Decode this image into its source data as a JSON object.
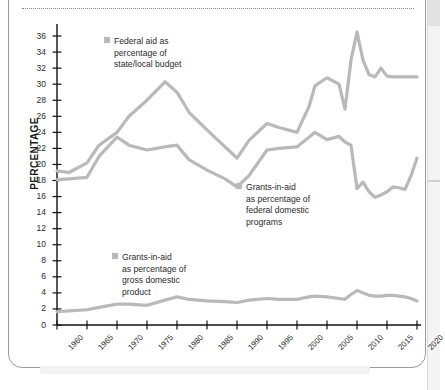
{
  "chart_data": {
    "type": "line",
    "title": "",
    "xlabel": "",
    "ylabel": "PERCENTAGE",
    "xlim": [
      1960,
      2020
    ],
    "ylim": [
      0,
      37
    ],
    "ytick_step": 2,
    "yticks": [
      0,
      2,
      4,
      6,
      8,
      10,
      12,
      14,
      16,
      18,
      20,
      22,
      24,
      26,
      28,
      30,
      32,
      34,
      36
    ],
    "xticks": [
      1960,
      1965,
      1970,
      1975,
      1980,
      1985,
      1990,
      1995,
      2000,
      2005,
      2010,
      2015,
      2020
    ],
    "grid": false,
    "legend_position": "inline-annotations",
    "line_color": "#b9b9b9",
    "series": [
      {
        "name": "Federal aid as percentage of state/local budget",
        "x": [
          1960,
          1962,
          1965,
          1967,
          1970,
          1972,
          1975,
          1978,
          1980,
          1982,
          1985,
          1988,
          1990,
          1992,
          1995,
          1997,
          2000,
          2002,
          2003,
          2005,
          2007,
          2008,
          2009,
          2010,
          2011,
          2012,
          2013,
          2014,
          2015,
          2016,
          2017,
          2018,
          2019,
          2020
        ],
        "values": [
          19.2,
          19.0,
          20.2,
          22.4,
          24.0,
          26.0,
          28.0,
          30.3,
          29.0,
          26.5,
          24.3,
          22.2,
          20.8,
          23.0,
          25.1,
          24.6,
          24.0,
          27.2,
          29.8,
          30.8,
          30.0,
          26.9,
          33.0,
          36.5,
          33.0,
          31.2,
          30.9,
          32.0,
          31.0,
          30.9,
          30.9,
          30.9,
          30.9,
          30.9
        ]
      },
      {
        "name": "Grants-in-aid as percentage of federal domestic programs",
        "x": [
          1960,
          1962,
          1965,
          1967,
          1970,
          1972,
          1975,
          1978,
          1980,
          1982,
          1985,
          1988,
          1990,
          1992,
          1995,
          1997,
          2000,
          2002,
          2003,
          2005,
          2007,
          2008,
          2009,
          2010,
          2011,
          2012,
          2013,
          2014,
          2015,
          2016,
          2017,
          2018,
          2019,
          2020
        ],
        "values": [
          18.1,
          18.2,
          18.4,
          21.0,
          23.4,
          22.4,
          21.8,
          22.2,
          22.4,
          20.6,
          19.3,
          18.2,
          17.2,
          18.6,
          21.8,
          22.0,
          22.2,
          23.4,
          24.0,
          23.1,
          23.5,
          22.8,
          22.4,
          17.0,
          17.8,
          16.6,
          15.9,
          16.2,
          16.6,
          17.2,
          17.1,
          16.9,
          18.6,
          20.8
        ]
      },
      {
        "name": "Grants-in-aid as percentage of gross domestic product",
        "x": [
          1960,
          1962,
          1965,
          1967,
          1970,
          1972,
          1975,
          1978,
          1980,
          1982,
          1985,
          1988,
          1990,
          1992,
          1995,
          1997,
          2000,
          2002,
          2003,
          2005,
          2007,
          2008,
          2009,
          2010,
          2011,
          2012,
          2013,
          2014,
          2015,
          2016,
          2017,
          2018,
          2019,
          2020
        ],
        "values": [
          1.65,
          1.75,
          1.9,
          2.2,
          2.6,
          2.6,
          2.45,
          3.1,
          3.5,
          3.2,
          3.0,
          2.9,
          2.8,
          3.1,
          3.3,
          3.2,
          3.2,
          3.5,
          3.6,
          3.5,
          3.3,
          3.2,
          3.8,
          4.3,
          4.0,
          3.7,
          3.6,
          3.6,
          3.7,
          3.7,
          3.6,
          3.5,
          3.3,
          3.0
        ]
      }
    ]
  },
  "yaxis": {
    "title": "PERCENTAGE",
    "labels": [
      "36",
      "34",
      "32",
      "30",
      "28",
      "26",
      "24",
      "22",
      "20",
      "18",
      "16",
      "14",
      "12",
      "10",
      "8",
      "6",
      "4",
      "2",
      "0"
    ]
  },
  "xaxis": {
    "labels": [
      "1960",
      "1965",
      "1970",
      "1975",
      "1980",
      "1985",
      "1990",
      "1995",
      "2000",
      "2005",
      "2010",
      "2015",
      "2020"
    ]
  },
  "legends": {
    "federal_aid": {
      "line1": "Federal aid as",
      "line2": "percentage of",
      "line3": "state/local budget"
    },
    "federal_domestic": {
      "line1": "Grants-in-aid",
      "line2": "as percentage of",
      "line3": "federal domestic",
      "line4": "programs"
    },
    "gdp": {
      "line1": "Grants-in-aid",
      "line2": "as percentage of",
      "line3": "gross domestic",
      "line4": "product"
    }
  }
}
